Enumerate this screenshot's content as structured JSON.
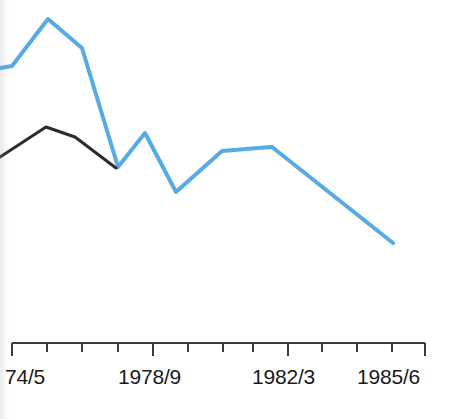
{
  "chart_data": {
    "type": "line",
    "title": "",
    "xlabel": "",
    "ylabel": "",
    "grid": false,
    "legend": "none",
    "axis": {
      "x_axis_line": true,
      "y_axis_line": false,
      "tick_labels": [
        "74/5",
        "1978/9",
        "1982/3",
        "1985/6"
      ],
      "tick_label_full": [
        "1974/5",
        "1978/9",
        "1982/3",
        "1985/6"
      ],
      "tick_label_x": [
        12,
        154,
        288,
        393
      ],
      "major_tick_x": [
        12,
        153,
        288,
        425
      ],
      "minor_tick_x": [
        47,
        82,
        118,
        188,
        223,
        253,
        322,
        357,
        392
      ],
      "axis_y": 343,
      "major_tick_len": 13,
      "minor_tick_len": 9,
      "x_start": 12,
      "x_end": 425,
      "note": "leftmost label is clipped by the image edge; full value is 1974/5"
    },
    "series": [
      {
        "name": "series-blue",
        "color": "#56aae6",
        "width": 4,
        "x": [
          0,
          12,
          48,
          82,
          118,
          145,
          176,
          222,
          258,
          272,
          393
        ],
        "y": [
          68,
          66,
          19,
          48,
          167,
          133,
          192,
          151,
          148,
          147,
          243
        ],
        "years": [
          "",
          "1974/5",
          "1975/6",
          "1976/7",
          "1977/8",
          "1978/9",
          "1979/80",
          "1980/1",
          "1981/2",
          "1982/3",
          "1985/6"
        ]
      },
      {
        "name": "series-black",
        "color": "#2e2c2b",
        "width": 3,
        "x": [
          0,
          46,
          75,
          116
        ],
        "y": [
          157,
          127,
          137,
          168
        ],
        "years": [
          "",
          "1974/5",
          "1975/6",
          "1976/7"
        ]
      }
    ],
    "ylim": [
      0,
      343
    ],
    "xlim": [
      0,
      461
    ]
  }
}
